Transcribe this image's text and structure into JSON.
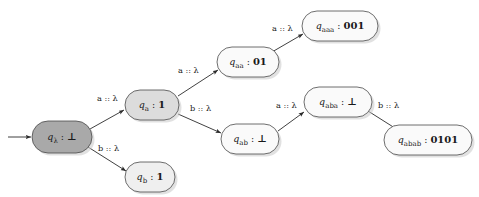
{
  "diagram": {
    "type": "state-transition-diagram",
    "title": "",
    "alphabet": [
      "a",
      "b"
    ],
    "epsilon_symbol": "λ",
    "bottom_symbol": "⊥",
    "colors": {
      "node_stroke": "#4a4a4a",
      "edge_stroke": "#2b2b2b",
      "text": "#1a1a1a",
      "fill_dark": "#a9a9a9",
      "fill_medium": "#dcdcdc",
      "fill_light": "#fafafa",
      "shadow": "#c8c8c8"
    },
    "start_marker": {
      "name": "start-arrow",
      "x1": 8,
      "y1": 137,
      "x2": 31,
      "y2": 137
    },
    "nodes": [
      {
        "id": "q_lambda",
        "state": "q",
        "subscript": "λ",
        "separator": ":",
        "output": "⊥",
        "cx": 62,
        "cy": 137,
        "rx": 30,
        "ry": 16,
        "fill": "#a9a9a9",
        "is_start": true
      },
      {
        "id": "q_a",
        "state": "q",
        "subscript": "a",
        "separator": ":",
        "output": "1",
        "cx": 152,
        "cy": 105,
        "rx": 27,
        "ry": 15,
        "fill": "#dcdcdc",
        "is_start": false
      },
      {
        "id": "q_b",
        "state": "q",
        "subscript": "b",
        "separator": ":",
        "output": "1",
        "cx": 150,
        "cy": 177,
        "rx": 25,
        "ry": 15,
        "fill": "#efefef",
        "is_start": false
      },
      {
        "id": "q_aa",
        "state": "q",
        "subscript": "aa",
        "separator": ":",
        "output": "01",
        "cx": 248,
        "cy": 62,
        "rx": 31,
        "ry": 15,
        "fill": "#fafafa",
        "is_start": false
      },
      {
        "id": "q_ab",
        "state": "q",
        "subscript": "ab",
        "separator": ":",
        "output": "⊥",
        "cx": 250,
        "cy": 139,
        "rx": 29,
        "ry": 15,
        "fill": "#fafafa",
        "is_start": false
      },
      {
        "id": "q_aaa",
        "state": "q",
        "subscript": "aaa",
        "separator": ":",
        "output": "001",
        "cx": 340,
        "cy": 26,
        "rx": 38,
        "ry": 15,
        "fill": "#fafafa",
        "is_start": false
      },
      {
        "id": "q_aba",
        "state": "q",
        "subscript": "aba",
        "separator": ":",
        "output": "⊥",
        "cx": 338,
        "cy": 102,
        "rx": 34,
        "ry": 15,
        "fill": "#fafafa",
        "is_start": false
      },
      {
        "id": "q_abab",
        "state": "q",
        "subscript": "abab",
        "separator": ":",
        "output": "0101",
        "cx": 428,
        "cy": 140,
        "rx": 44,
        "ry": 15,
        "fill": "#fafafa",
        "is_start": false
      }
    ],
    "edges": [
      {
        "id": "e-lambda-a",
        "from": "q_lambda",
        "to": "q_a",
        "input": "a",
        "output": "λ",
        "label": "a :: λ",
        "x1": 90,
        "y1": 129,
        "x2": 124,
        "y2": 110,
        "lx": 97,
        "ly": 101
      },
      {
        "id": "e-lambda-b",
        "from": "q_lambda",
        "to": "q_b",
        "input": "b",
        "output": "λ",
        "label": "b :: λ",
        "x1": 88,
        "y1": 147,
        "x2": 126,
        "y2": 171,
        "lx": 98,
        "ly": 151
      },
      {
        "id": "e-a-aa",
        "from": "q_a",
        "to": "q_aa",
        "input": "a",
        "output": "λ",
        "label": "a :: λ",
        "x1": 178,
        "y1": 96,
        "x2": 218,
        "y2": 70,
        "lx": 178,
        "ly": 73
      },
      {
        "id": "e-a-ab",
        "from": "q_a",
        "to": "q_ab",
        "input": "b",
        "output": "λ",
        "label": "b :: λ",
        "x1": 178,
        "y1": 114,
        "x2": 221,
        "y2": 133,
        "lx": 190,
        "ly": 111
      },
      {
        "id": "e-aa-aaa",
        "from": "q_aa",
        "to": "q_aaa",
        "input": "a",
        "output": "λ",
        "label": "a :: λ",
        "x1": 272,
        "y1": 52,
        "x2": 303,
        "y2": 34,
        "lx": 272,
        "ly": 31
      },
      {
        "id": "e-ab-aba",
        "from": "q_ab",
        "to": "q_aba",
        "input": "a",
        "output": "λ",
        "label": "a :: λ",
        "x1": 278,
        "y1": 131,
        "x2": 304,
        "y2": 112,
        "lx": 276,
        "ly": 108
      },
      {
        "id": "e-aba-abab",
        "from": "q_aba",
        "to": "q_abab",
        "input": "b",
        "output": "λ",
        "label": "b :: λ",
        "x1": 368,
        "y1": 111,
        "x2": 398,
        "y2": 130,
        "lx": 378,
        "ly": 108
      }
    ]
  }
}
